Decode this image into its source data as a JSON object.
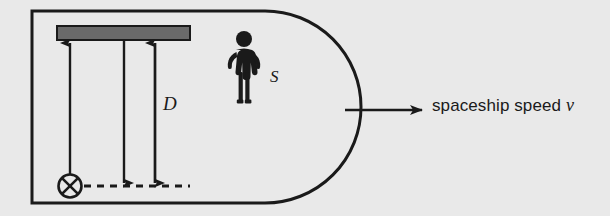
{
  "figure": {
    "kind": "physics-diagram",
    "background_color": "#e9e9e9",
    "ink_color": "#1a1a1a",
    "mirror_fill_color": "#6a6a6a"
  },
  "labels": {
    "distance": "D",
    "observer": "S",
    "speed_caption_text": "spaceship speed",
    "speed_caption_symbol": "v"
  },
  "icons": {
    "light_source": "circled-x-icon",
    "observer_figure": "standing-person-icon",
    "mirror": "mirror-bar-icon",
    "motion_arrow": "arrow-right-icon",
    "beam_up_arrow": "arrow-up-icon",
    "beam_down_arrow": "arrow-down-icon",
    "distance_arrow": "double-headed-arrow-icon",
    "floor_line": "dashed-line-icon"
  },
  "geometry": {
    "hull_left": 32,
    "hull_top": 11,
    "hull_bottom": 203,
    "hull_body_right": 265,
    "hull_nose_right": 345,
    "mirror_x": 57,
    "mirror_y": 26,
    "mirror_width": 133,
    "mirror_height": 14,
    "source_cx": 70,
    "source_cy": 186,
    "source_r": 11,
    "dashed_y": 186,
    "dashed_x_start": 84,
    "dashed_x_end": 186,
    "beam_up_x": 70,
    "beam_down_x": 124,
    "distance_arrow_x": 155,
    "motion_arrow_y": 110,
    "motion_arrow_x_start": 345,
    "motion_arrow_x_end": 424
  }
}
